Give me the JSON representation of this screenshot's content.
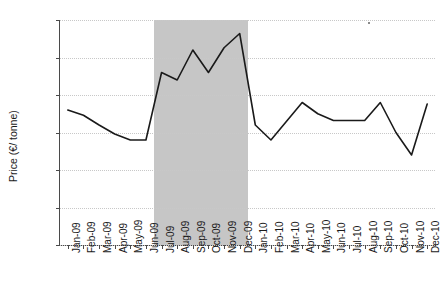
{
  "chart_data": {
    "type": "line",
    "title": "",
    "xlabel": "",
    "ylabel": "Price (€/ tonne)",
    "ylim": [
      85,
      115
    ],
    "ytick_values": [
      85,
      90,
      95,
      100,
      105,
      110,
      115
    ],
    "ytick_labels": [
      "85",
      "90",
      "95",
      "100",
      "105",
      "110",
      "115"
    ],
    "grid": true,
    "legend": "none",
    "categories": [
      "Jan-09",
      "Feb-09",
      "Mar-09",
      "Apr-09",
      "May-09",
      "Jun-09",
      "Jul-09",
      "Aug-09",
      "Sep-09",
      "Oct-09",
      "Nov-09",
      "Dec-09",
      "Jan-10",
      "Feb-10",
      "Mar-10",
      "Apr-10",
      "May-10",
      "Jun-10",
      "Jul-10",
      "Aug-10",
      "Sep-10",
      "Oct-10",
      "Nov-10",
      "Dec-10"
    ],
    "values": [
      103.0,
      102.3,
      101.0,
      99.8,
      99.0,
      99.0,
      108.0,
      107.0,
      111.0,
      108.0,
      111.3,
      113.2,
      101.0,
      99.0,
      101.5,
      104.0,
      102.5,
      101.6,
      101.6,
      101.6,
      104.0,
      100.0,
      97.0,
      103.8
    ],
    "series_color": "#1a1a1a",
    "annotations": [
      {
        "type": "shaded-band",
        "label": "Jul-09 to Dec-09 highlighted period",
        "from": "Jul-09",
        "to": "Dec-09",
        "color": "#c6c6c6"
      }
    ]
  }
}
